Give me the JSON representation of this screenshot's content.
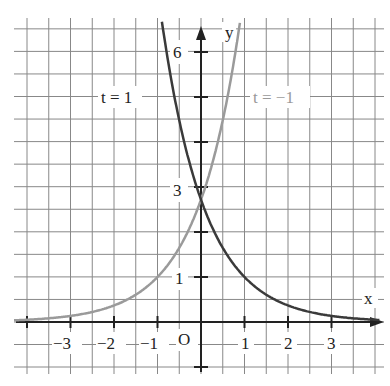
{
  "chart_data": {
    "type": "line",
    "title": "",
    "xlabel": "x",
    "ylabel": "y",
    "origin_label": "O",
    "xlim": [
      -4.3,
      4.2
    ],
    "ylim": [
      -0.9,
      6.5
    ],
    "grid": true,
    "grid_step": 0.5,
    "x_tick_labels": [
      "-3",
      "-2",
      "-1",
      "1",
      "2",
      "3"
    ],
    "y_tick_labels": [
      "1",
      "3",
      "6"
    ],
    "series": [
      {
        "name": "t = 1",
        "formula": "y = e^(1 - x)",
        "color": "#333333",
        "x": [
          -0.8,
          -0.5,
          0,
          0.5,
          1,
          1.5,
          2,
          2.5,
          3,
          3.5,
          4
        ],
        "y": [
          6.05,
          4.48,
          2.72,
          1.65,
          1.0,
          0.61,
          0.37,
          0.22,
          0.14,
          0.08,
          0.05
        ]
      },
      {
        "name": "t = -1",
        "formula": "y = e^(1 + x)",
        "color": "#999999",
        "x": [
          -4,
          -3.5,
          -3,
          -2.5,
          -2,
          -1.5,
          -1,
          -0.5,
          0,
          0.5,
          0.8
        ],
        "y": [
          0.05,
          0.08,
          0.14,
          0.22,
          0.37,
          0.61,
          1.0,
          1.65,
          2.72,
          4.48,
          6.05
        ]
      }
    ],
    "annotations": [
      {
        "text": "t = 1",
        "x": -1.7,
        "y": 4.5
      },
      {
        "text": "t = −1",
        "x": 1.3,
        "y": 4.5
      }
    ]
  },
  "labels": {
    "x_axis": "x",
    "y_axis": "y",
    "origin": "O",
    "xt_m3": "−3",
    "xt_m2": "−2",
    "xt_m1": "−1",
    "xt_1": "1",
    "xt_2": "2",
    "xt_3": "3",
    "yt_1": "1",
    "yt_3": "3",
    "yt_6": "6",
    "curve_dark": "t = 1",
    "curve_light": "t = −1"
  }
}
